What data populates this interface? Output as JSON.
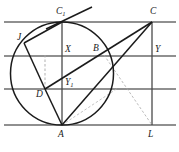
{
  "figure": {
    "width": 179,
    "height": 152,
    "background_color": "#ffffff",
    "stroke_color_primary": "#1b1b1b",
    "stroke_color_grid": "#6b6b6b",
    "stroke_color_dashed": "#9a9a9a"
  },
  "labels": {
    "C1": "C",
    "C1_sub": "1",
    "C": "C",
    "J": "J",
    "X": "X",
    "B": "B",
    "Y": "Y",
    "Y1": "Y",
    "Y1_sub": "1",
    "D": "D",
    "A": "A",
    "L": "L"
  },
  "points": [
    {
      "name": "C1",
      "label": "C₁",
      "x": 62,
      "y": 22
    },
    {
      "name": "C",
      "label": "C",
      "x": 152,
      "y": 22
    },
    {
      "name": "J",
      "label": "J",
      "x": 24,
      "y": 43
    },
    {
      "name": "X",
      "label": "X",
      "x": 62,
      "y": 56
    },
    {
      "name": "B",
      "label": "B",
      "x": 101,
      "y": 56
    },
    {
      "name": "Y",
      "label": "Y",
      "x": 152,
      "y": 56
    },
    {
      "name": "Y1",
      "label": "Y₁",
      "x": 62,
      "y": 89
    },
    {
      "name": "D",
      "label": "D",
      "x": 45,
      "y": 89
    },
    {
      "name": "A",
      "label": "A",
      "x": 62,
      "y": 125
    },
    {
      "name": "L",
      "label": "L",
      "x": 152,
      "y": 125
    }
  ],
  "horizontal_lines": [
    {
      "name": "top-line",
      "y": 22,
      "x1": 4,
      "x2": 176
    },
    {
      "name": "middle-line",
      "y": 56,
      "x1": 4,
      "x2": 176
    },
    {
      "name": "lower-line",
      "y": 89,
      "x1": 4,
      "x2": 176
    },
    {
      "name": "bottom-line",
      "y": 125,
      "x1": 4,
      "x2": 176
    }
  ],
  "vertical_lines": [
    {
      "name": "left-vertical",
      "x": 62,
      "y1": 22,
      "y2": 125
    },
    {
      "name": "right-vertical",
      "x": 152,
      "y1": 22,
      "y2": 125
    }
  ],
  "circle": {
    "name": "main-circle",
    "cx": 62,
    "cy": 73.5,
    "r": 51.5
  },
  "solid_segments": [
    {
      "name": "segment-J-C1",
      "x1": 24,
      "y1": 43,
      "x2": 62,
      "y2": 22
    },
    {
      "name": "segment-J-D",
      "x1": 24,
      "y1": 43,
      "x2": 45,
      "y2": 89
    },
    {
      "name": "segment-D-A",
      "x1": 45,
      "y1": 89,
      "x2": 62,
      "y2": 125
    },
    {
      "name": "segment-D-C",
      "x1": 45,
      "y1": 89,
      "x2": 152,
      "y2": 22
    },
    {
      "name": "segment-A-C",
      "x1": 62,
      "y1": 125,
      "x2": 152,
      "y2": 22
    },
    {
      "name": "tangent-at-C1",
      "x1": 48,
      "y1": 28,
      "x2": 90,
      "y2": 8
    }
  ],
  "dashed_segments": [
    {
      "name": "dashed-A-C-ray",
      "x1": 62,
      "y1": 125,
      "x2": 152,
      "y2": 22
    },
    {
      "name": "dashed-C-L",
      "x1": 152,
      "y1": 22,
      "x2": 152,
      "y2": 125
    },
    {
      "name": "dashed-A-L-diag",
      "x1": 103,
      "y1": 56,
      "x2": 152,
      "y2": 125
    },
    {
      "name": "dashed-X-D-drop",
      "x1": 45,
      "y1": 56,
      "x2": 45,
      "y2": 89
    }
  ]
}
